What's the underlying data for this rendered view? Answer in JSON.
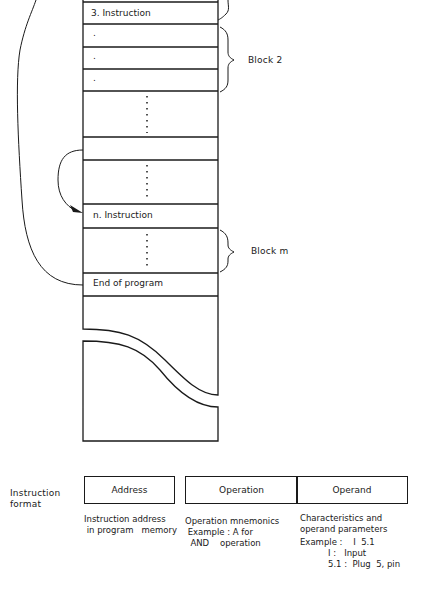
{
  "memory": {
    "rows": [
      {
        "label": "3. Instruction"
      },
      {
        "label": "."
      },
      {
        "label": "."
      },
      {
        "label": "."
      },
      {
        "label": ""
      },
      {
        "label": ""
      },
      {
        "label": ""
      },
      {
        "label": "n. Instruction"
      },
      {
        "label": ""
      },
      {
        "label": "End of program"
      }
    ]
  },
  "blocks": {
    "block2": "Block  2",
    "blockm": "Block   m"
  },
  "instruction_format": {
    "title_line1": "Instruction",
    "title_line2": "format",
    "fields": {
      "address": "Address",
      "operation": "Operation",
      "operand": "Operand"
    },
    "descriptions": {
      "address": "Instruction address\n in program   memory",
      "operation": "Operation mnemonics\n Example : A for\n  AND    operation",
      "operand_l1": "Characteristics and",
      "operand_l2": "operand parameters",
      "operand_example": "Example :    I  5.1",
      "operand_i": "I :   Input",
      "operand_51": "5.1 :  Plug  5, pin"
    }
  },
  "colors": {
    "line": "#1a1a1a",
    "background": "#ffffff"
  }
}
